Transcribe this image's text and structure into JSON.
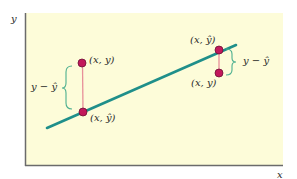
{
  "diagram": {
    "type": "regression-residuals",
    "axes": {
      "x_label": "x",
      "y_label": "y"
    },
    "colors": {
      "background": "#fdfcd9",
      "axis": "#6b6b6b",
      "regression_line": "#1f8f8a",
      "residual_segment": "#e8909a",
      "point_fill": "#c2185b",
      "point_stroke": "#6d1036",
      "brace": "#4caf8f"
    },
    "regression_line": {
      "x1": 47,
      "y1": 128,
      "x2": 236,
      "y2": 45
    },
    "points": [
      {
        "id": "left-observed",
        "label": "(x, y)",
        "cx": 82,
        "cy": 63
      },
      {
        "id": "left-predicted",
        "label": "(x, ŷ)",
        "cx": 83,
        "cy": 112
      },
      {
        "id": "right-predicted",
        "label": "(x, ŷ)",
        "cx": 219,
        "cy": 50
      },
      {
        "id": "right-observed",
        "label": "(x, y)",
        "cx": 219,
        "cy": 73
      }
    ],
    "residual_labels": [
      {
        "side": "left",
        "text": "y − ŷ"
      },
      {
        "side": "right",
        "text": "y − ŷ"
      }
    ]
  }
}
